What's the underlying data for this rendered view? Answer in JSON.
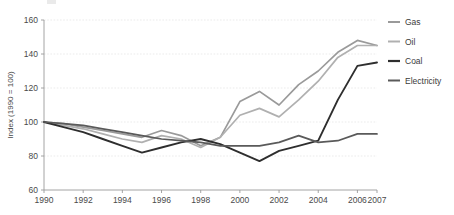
{
  "chart_data": {
    "type": "line",
    "title": "",
    "xlabel": "",
    "ylabel": "Index (1990 = 100)",
    "xlim": [
      1990,
      2007
    ],
    "ylim": [
      60,
      160
    ],
    "grid": true,
    "legend_position": "right",
    "x": [
      1990,
      1991,
      1992,
      1993,
      1994,
      1995,
      1996,
      1997,
      1998,
      1999,
      2000,
      2001,
      2002,
      2003,
      2004,
      2005,
      2006,
      2007
    ],
    "xticks": [
      "1990",
      "1992",
      "1994",
      "1996",
      "1998",
      "2000",
      "2002",
      "2004",
      "2006",
      "2007"
    ],
    "xtick_values": [
      1990,
      1992,
      1994,
      1996,
      1998,
      2000,
      2002,
      2004,
      2006,
      2007
    ],
    "yticks": [
      "60",
      "80",
      "100",
      "120",
      "140",
      "160"
    ],
    "ytick_values": [
      60,
      80,
      100,
      120,
      140,
      160
    ],
    "series": [
      {
        "name": "Gas",
        "color": "#9a9a9a",
        "width": 1.7,
        "values": [
          100,
          99,
          97,
          95,
          93,
          91,
          95,
          92,
          86,
          91,
          112,
          118,
          110,
          122,
          130,
          141,
          148,
          145
        ]
      },
      {
        "name": "Oil",
        "color": "#b0b0b0",
        "width": 1.7,
        "values": [
          100,
          98,
          96,
          93,
          90,
          88,
          92,
          90,
          85,
          91,
          104,
          108,
          103,
          113,
          124,
          138,
          145,
          145
        ]
      },
      {
        "name": "Coal",
        "color": "#2e2e2e",
        "width": 1.9,
        "values": [
          100,
          97,
          94,
          90,
          86,
          82,
          85,
          88,
          90,
          87,
          82,
          77,
          83,
          86,
          89,
          113,
          133,
          135
        ]
      },
      {
        "name": "Electricity",
        "color": "#5a5a5a",
        "width": 1.7,
        "values": [
          100,
          99,
          98,
          96,
          94,
          92,
          90,
          89,
          88,
          86,
          86,
          86,
          88,
          92,
          88,
          89,
          93,
          93
        ]
      }
    ]
  },
  "legend": {
    "items": [
      {
        "label": "Gas"
      },
      {
        "label": "Oil"
      },
      {
        "label": "Coal"
      },
      {
        "label": "Electricity"
      }
    ]
  }
}
